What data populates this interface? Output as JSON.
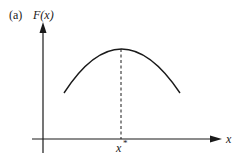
{
  "figure": {
    "panel_label": "(a)",
    "y_axis_label": "F(x)",
    "x_axis_label": "x",
    "optimum_label": "x",
    "optimum_superscript": "*",
    "colors": {
      "ink": "#1a1a1a",
      "background": "#ffffff"
    },
    "curve": {
      "shape": "concave-down parabola",
      "start": [
        64,
        93
      ],
      "peak": [
        121,
        49
      ],
      "end": [
        180,
        93
      ]
    },
    "axes": {
      "origin": [
        43,
        139
      ],
      "y_axis_top": [
        43,
        23
      ],
      "y_axis_bottom": [
        43,
        153
      ],
      "x_axis_left": [
        32,
        139
      ],
      "x_axis_right": [
        221,
        139
      ]
    },
    "dashed_line": {
      "x": 121,
      "from_y": 49,
      "to_y": 139
    }
  }
}
